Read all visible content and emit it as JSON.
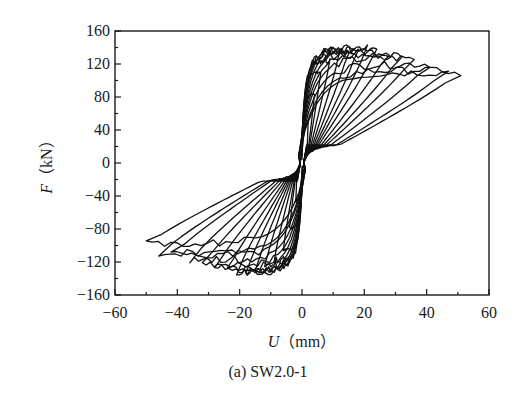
{
  "chart_data": {
    "type": "line",
    "subtype": "hysteresis",
    "title": "",
    "caption": "(a) SW2.0-1",
    "xlabel": "U（mm）",
    "xlabel_var": "U",
    "xlabel_unit": "（mm）",
    "ylabel": "F（kN）",
    "ylabel_var": "F",
    "ylabel_unit": "（kN）",
    "xlim": [
      -60,
      60
    ],
    "ylim": [
      -160,
      160
    ],
    "xticks": [
      -60,
      -40,
      -20,
      0,
      20,
      40,
      60
    ],
    "xtick_labels": [
      "−60",
      "−40",
      "−20",
      "0",
      "20",
      "40",
      "60"
    ],
    "yticks": [
      -160,
      -120,
      -80,
      -40,
      0,
      40,
      80,
      120,
      160
    ],
    "ytick_labels": [
      "−160",
      "−120",
      "−80",
      "−40",
      "0",
      "40",
      "80",
      "120",
      "160"
    ],
    "minor_xticks_step": 10,
    "minor_yticks_step": 20,
    "grid": false,
    "legend": null,
    "series": [
      {
        "name": "loop-1",
        "u_pos": 2,
        "f_pos": 55,
        "u_neg": -2,
        "f_neg": -50
      },
      {
        "name": "loop-2",
        "u_pos": 4,
        "f_pos": 85,
        "u_neg": -4,
        "f_neg": -80
      },
      {
        "name": "loop-3",
        "u_pos": 6,
        "f_pos": 110,
        "u_neg": -6,
        "f_neg": -105
      },
      {
        "name": "loop-4",
        "u_pos": 9,
        "f_pos": 125,
        "u_neg": -9,
        "f_neg": -118
      },
      {
        "name": "loop-5",
        "u_pos": 12,
        "f_pos": 132,
        "u_neg": -12,
        "f_neg": -125
      },
      {
        "name": "loop-6",
        "u_pos": 15,
        "f_pos": 136,
        "u_neg": -15,
        "f_neg": -130
      },
      {
        "name": "loop-7",
        "u_pos": 18,
        "f_pos": 138,
        "u_neg": -18,
        "f_neg": -132
      },
      {
        "name": "loop-8",
        "u_pos": 21,
        "f_pos": 140,
        "u_neg": -21,
        "f_neg": -133
      },
      {
        "name": "loop-9",
        "u_pos": 24,
        "f_pos": 138,
        "u_neg": -24,
        "f_neg": -130
      },
      {
        "name": "loop-10",
        "u_pos": 28,
        "f_pos": 135,
        "u_neg": -28,
        "f_neg": -127
      },
      {
        "name": "loop-11",
        "u_pos": 32,
        "f_pos": 131,
        "u_neg": -32,
        "f_neg": -123
      },
      {
        "name": "loop-12",
        "u_pos": 36,
        "f_pos": 127,
        "u_neg": -36,
        "f_neg": -118
      },
      {
        "name": "loop-13",
        "u_pos": 41,
        "f_pos": 120,
        "u_neg": -42,
        "f_neg": -112
      },
      {
        "name": "loop-14",
        "u_pos": 47,
        "f_pos": 113,
        "u_neg": -46,
        "f_neg": -110
      },
      {
        "name": "loop-15",
        "u_pos": 51,
        "f_pos": 110,
        "u_neg": -50,
        "f_neg": -98
      }
    ],
    "peak_load_positive": {
      "u": 21,
      "f": 140
    },
    "peak_load_negative": {
      "u": -18,
      "f": -133
    }
  }
}
